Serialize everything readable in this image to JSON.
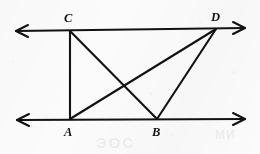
{
  "figure": {
    "background_color": "#fbfbfb",
    "stroke_color": "#121212",
    "label_color": "#141414",
    "width": 260,
    "height": 154
  },
  "vertices": [
    {
      "id": "C",
      "label": "C",
      "x": 70,
      "y": 31,
      "label_x": 64,
      "label_y": 12,
      "on_line": "top"
    },
    {
      "id": "D",
      "label": "D",
      "x": 216,
      "y": 29,
      "label_x": 211,
      "label_y": 11,
      "on_line": "top"
    },
    {
      "id": "A",
      "label": "A",
      "x": 70,
      "y": 119,
      "label_x": 64,
      "label_y": 126,
      "on_line": "bottom"
    },
    {
      "id": "B",
      "label": "B",
      "x": 157,
      "y": 119,
      "label_x": 152,
      "label_y": 126,
      "on_line": "bottom"
    }
  ],
  "lines": [
    {
      "id": "top-line",
      "name": "upper-parallel-line",
      "x1": 16,
      "y1": 31,
      "x2": 245,
      "y2": 28,
      "arrow_start": true,
      "arrow_end": true
    },
    {
      "id": "bottom-line",
      "name": "lower-parallel-line",
      "x1": 17,
      "y1": 120,
      "x2": 245,
      "y2": 119,
      "arrow_start": true,
      "arrow_end": true
    }
  ],
  "segments": [
    {
      "id": "CA",
      "label": "CA",
      "x1": 70,
      "y1": 31,
      "x2": 70,
      "y2": 119
    },
    {
      "id": "CB",
      "label": "CB",
      "x1": 70,
      "y1": 31,
      "x2": 157,
      "y2": 119
    },
    {
      "id": "AD",
      "label": "AD",
      "x1": 70,
      "y1": 119,
      "x2": 216,
      "y2": 29
    },
    {
      "id": "BD",
      "label": "BD",
      "x1": 157,
      "y1": 119,
      "x2": 216,
      "y2": 29
    }
  ],
  "arrowheads": [
    {
      "id": "top-left",
      "points": "28,25 16,31 28,37"
    },
    {
      "id": "top-right",
      "points": "233,22 245,28 233,34"
    },
    {
      "id": "bottom-left",
      "points": "29,114 17,120 29,126"
    },
    {
      "id": "bottom-right",
      "points": "233,113 245,119 233,125"
    }
  ],
  "artifacts": {
    "bleed_bottom": "ЭОС",
    "bleed_right": "NM"
  }
}
